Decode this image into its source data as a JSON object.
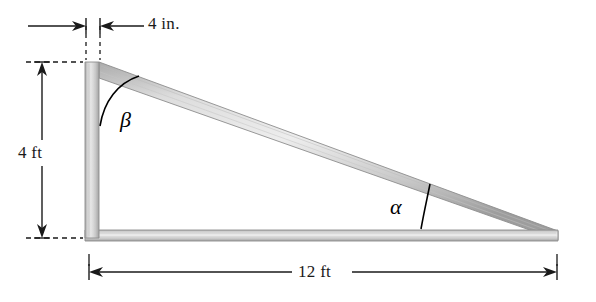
{
  "figure": {
    "background_color": "#ffffff",
    "line_color": "#1a1a1a",
    "beam_fill_light": "#e8e8e8",
    "beam_fill_mid": "#c9c9c9",
    "beam_fill_dark": "#9a9a9a",
    "beam_edge_color": "#8d8d8d"
  },
  "dimensions": {
    "top": {
      "label": "4 in.",
      "orientation": "horizontal",
      "arrow_style": "inward-pointing",
      "extension_line_style": "dashed"
    },
    "left": {
      "label": "4 ft",
      "orientation": "vertical",
      "arrow_style": "double-headed-outward",
      "extension_line_style": "dashed"
    },
    "bottom": {
      "label": "12 ft",
      "orientation": "horizontal",
      "arrow_style": "double-headed-outward",
      "extension_line_style": "solid-tick"
    }
  },
  "angles": [
    {
      "name": "beta",
      "label": "β",
      "location": "top-left vertex between vertical post and diagonal beam"
    },
    {
      "name": "alpha",
      "label": "α",
      "location": "right vertex between bottom beam and diagonal beam"
    }
  ],
  "members": [
    {
      "name": "vertical-post",
      "orientation": "vertical",
      "length_label": "4 ft"
    },
    {
      "name": "bottom-beam",
      "orientation": "horizontal",
      "length_label": "12 ft"
    },
    {
      "name": "diagonal-beam",
      "orientation": "diagonal",
      "width_label": "4 in."
    }
  ]
}
